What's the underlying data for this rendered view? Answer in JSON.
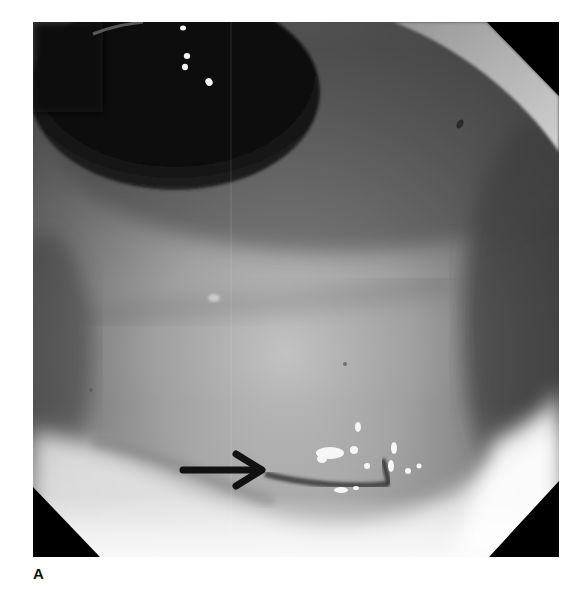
{
  "figure": {
    "panel_label": "A",
    "annotation": {
      "type": "arrow",
      "direction": "right",
      "color": "#111111"
    },
    "colors": {
      "lumen": "#0a0a0a",
      "mucosa_dark": "#3c3c3c",
      "mucosa_mid": "#7e7e7e",
      "mucosa_light": "#c6c6c6",
      "highlight": "#f4f4f4",
      "corner_mask": "#000000",
      "background": "#ffffff"
    }
  }
}
